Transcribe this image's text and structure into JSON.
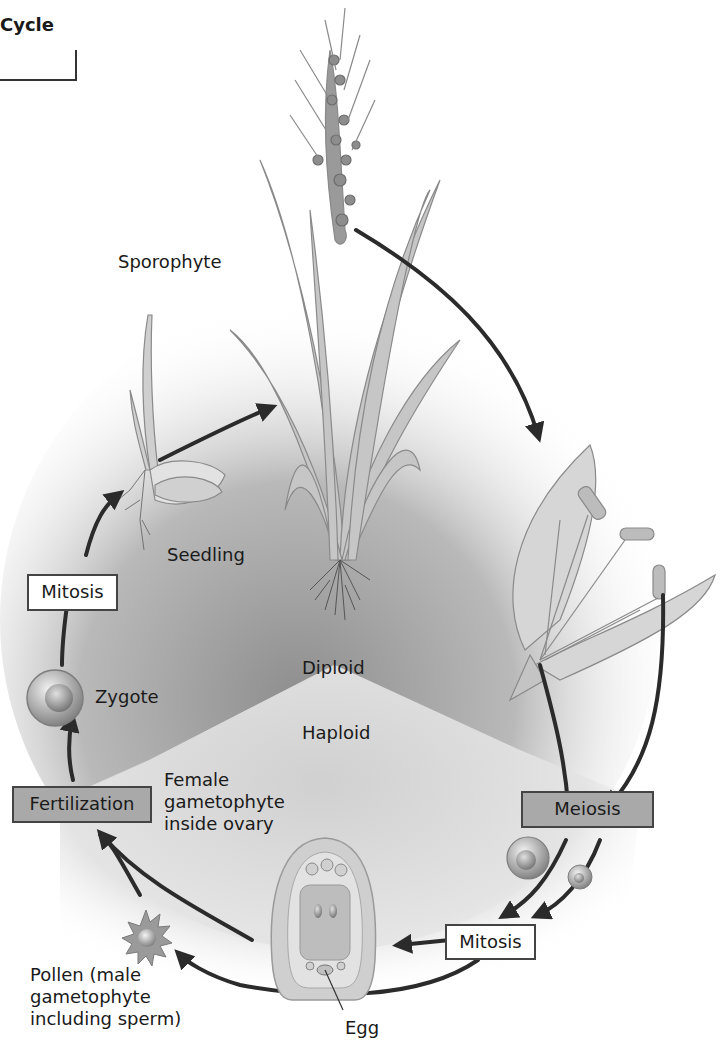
{
  "title": "Cycle",
  "labels": {
    "sporophyte": "Sporophyte",
    "seedling": "Seedling",
    "zygote": "Zygote",
    "diploid": "Diploid",
    "haploid": "Haploid",
    "female_gametophyte": "Female\ngametophyte\ninside ovary",
    "pollen": "Pollen (male\ngametophyte\nincluding sperm)",
    "egg": "Egg"
  },
  "boxes": {
    "mitosis_left": "Mitosis",
    "fertilization": "Fertilization",
    "meiosis": "Meiosis",
    "mitosis_bottom": "Mitosis"
  },
  "colors": {
    "diploid_zone": "#9a9a9a",
    "haploid_zone": "#d4d4d4",
    "arrow": "#2b2b2b",
    "process_box_gray": "#a9a9a9",
    "process_box_white": "#ffffff",
    "plant": "#b8b8b8"
  }
}
